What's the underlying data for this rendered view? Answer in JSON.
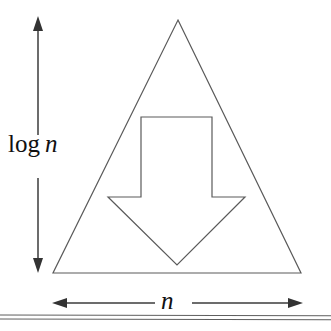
{
  "figure": {
    "background_color": "#ffffff",
    "stroke_color": "#4a4a4a",
    "text_color": "#111111",
    "labels": {
      "height_prefix": "log",
      "height_variable": "n",
      "height_full": "log n",
      "width_variable": "n"
    },
    "shapes": {
      "triangle": {
        "name": "outer-triangle",
        "apex": [
          178,
          20
        ],
        "bottom_left": [
          53,
          273
        ],
        "bottom_right": [
          301,
          273
        ]
      },
      "down_arrow": {
        "name": "inner-down-arrow",
        "shaft_left": 141,
        "shaft_right": 212,
        "shaft_top": 117,
        "shoulder_y": 197,
        "barb_left": 108,
        "barb_right": 245,
        "tip": [
          177,
          265
        ]
      }
    },
    "annotations": {
      "vertical_dimension": {
        "name": "height-dimension-arrow",
        "x": 38,
        "top": 18,
        "bottom": 272,
        "gap_top": 135,
        "gap_bottom": 178
      },
      "horizontal_dimension": {
        "name": "width-dimension-arrow",
        "y": 303,
        "left": 53,
        "right": 302,
        "gap_left": 155,
        "gap_right": 190
      }
    },
    "rules": {
      "name": "bottom-double-rule",
      "y_positions": [
        315,
        319
      ],
      "x_start": 0,
      "x_end": 331
    }
  }
}
